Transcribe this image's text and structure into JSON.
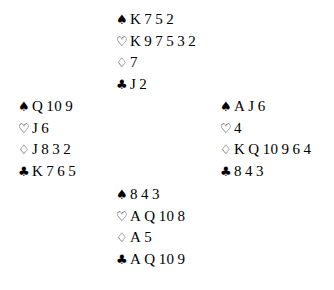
{
  "diagram": {
    "type": "bridge-deal-diagram",
    "background_color": "#ffffff",
    "text_color": "#000000",
    "suit_symbols": {
      "spade": "♠",
      "heart": "♡",
      "diamond": "♢",
      "club": "♣"
    },
    "suit_names": {
      "spade": "spades",
      "heart": "hearts",
      "diamond": "diamonds",
      "club": "clubs"
    },
    "hands": {
      "north": {
        "position": "North",
        "spades": "K 7 5 2",
        "hearts": "K 9 7 5 3 2",
        "diamonds": "7",
        "clubs": "J 2"
      },
      "west": {
        "position": "West",
        "spades": "Q 10 9",
        "hearts": "J 6",
        "diamonds": "J 8 3 2",
        "clubs": "K 7 6 5"
      },
      "east": {
        "position": "East",
        "spades": "A J 6",
        "hearts": "4",
        "diamonds": "K Q 10 9 6 4",
        "clubs": "8 4 3"
      },
      "south": {
        "position": "South",
        "spades": "8 4 3",
        "hearts": "A Q 10 8",
        "diamonds": "A 5",
        "clubs": "A Q 10 9"
      }
    }
  }
}
